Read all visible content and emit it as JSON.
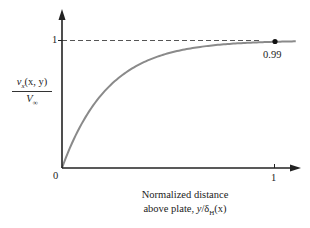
{
  "chart_data": {
    "type": "line",
    "title": "",
    "xlabel": "Normalized distance above plate, y/δH(x)",
    "ylabel": "vx(x, y) / V∞",
    "x_ticks": [
      "0",
      "1"
    ],
    "y_ticks": [
      "0",
      "1"
    ],
    "xlim": [
      0,
      1.1
    ],
    "ylim": [
      0,
      1.2
    ],
    "grid": false,
    "legend": null,
    "series": [
      {
        "name": "velocity profile",
        "color": "#8a8a8a",
        "x": [
          0,
          0.05,
          0.1,
          0.2,
          0.3,
          0.4,
          0.5,
          0.6,
          0.7,
          0.8,
          0.9,
          1.0,
          1.1
        ],
        "y": [
          0,
          0.21,
          0.37,
          0.6,
          0.75,
          0.84,
          0.9,
          0.94,
          0.96,
          0.975,
          0.984,
          0.99,
          0.993
        ]
      }
    ],
    "reference_line": {
      "y": 1,
      "style": "dashed",
      "color": "#555555"
    },
    "annotations": [
      {
        "x": 1,
        "y": 0.99,
        "text": "0.99",
        "marker": "filled-circle"
      }
    ]
  },
  "labels": {
    "origin": "0",
    "y_tick_one": "1",
    "x_tick_one": "1",
    "point_value": "0.99",
    "ylabel_numerator_v": "v",
    "ylabel_numerator_sub": "x",
    "ylabel_numerator_args": "(x, y)",
    "ylabel_denominator_v": "V",
    "ylabel_denominator_sub": "∞",
    "xlabel_line1": "Normalized distance",
    "xlabel_line2_prefix": "above plate, ",
    "xlabel_line2_y": "y",
    "xlabel_line2_delta": "/δ",
    "xlabel_line2_sub": "H",
    "xlabel_line2_args": "(x)"
  },
  "colors": {
    "axis": "#222222",
    "curve": "#8a8a8a",
    "dashed": "#555555",
    "point": "#111111"
  }
}
